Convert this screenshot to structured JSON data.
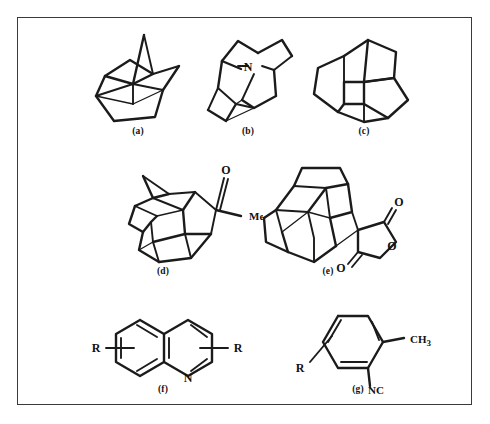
{
  "figure": {
    "border_color": "#3a3a3a",
    "background": "#ffffff",
    "ink_color": "#1b1b1b",
    "panel_count": 7
  },
  "panels": [
    {
      "id": "a",
      "caption": "(a)",
      "name": "protoadamantane-cage",
      "description": "polycyclic hydrocarbon cage drawn in perspective, no heteroatom labels",
      "labels": []
    },
    {
      "id": "b",
      "caption": "(b)",
      "name": "azaadamantane-cage",
      "description": "adamantane-type cage with a bridgehead nitrogen",
      "labels": [
        {
          "text": "N",
          "name": "nitrogen-label"
        }
      ]
    },
    {
      "id": "c",
      "caption": "(c)",
      "name": "fused-polycyclic-cage",
      "description": "fused cyclopentane/cyclobutane polyquinane cage",
      "labels": []
    },
    {
      "id": "d",
      "caption": "(d)",
      "name": "acetyl-dodecahedrane-cage",
      "description": "dodecahedrane-type cage bearing an acetyl (methyl ketone) substituent",
      "labels": [
        {
          "text": "O",
          "name": "carbonyl-oxygen-label"
        },
        {
          "text": "Me",
          "name": "methyl-label"
        }
      ]
    },
    {
      "id": "e",
      "caption": "(e)",
      "name": "cage-anhydride",
      "description": "polycyclic cage fused to a cyclic carboxylic anhydride (succinic anhydride ring)",
      "labels": [
        {
          "text": "O",
          "name": "anhydride-carbonyl-oxygen-upper-label"
        },
        {
          "text": "O",
          "name": "anhydride-ring-oxygen-label"
        },
        {
          "text": "O",
          "name": "anhydride-carbonyl-oxygen-lower-label"
        }
      ]
    },
    {
      "id": "f",
      "caption": "(f)",
      "name": "disubstituted-quinoline",
      "description": "quinoline bicyclic aromatic with two R substituents shown on floating bonds",
      "labels": [
        {
          "text": "R",
          "name": "r-group-left-label"
        },
        {
          "text": "N",
          "name": "quinoline-nitrogen-label"
        },
        {
          "text": "R",
          "name": "r-group-right-label"
        }
      ]
    },
    {
      "id": "g",
      "caption": "(g)",
      "name": "substituted-aryl-isocyanide",
      "description": "benzene ring bearing methyl, isocyano and a floating R substituent",
      "labels": [
        {
          "text": "R",
          "name": "r-group-label"
        },
        {
          "text": "CH",
          "sub": "3",
          "name": "methyl-label"
        },
        {
          "text": "NC",
          "name": "isocyano-label"
        }
      ]
    }
  ]
}
